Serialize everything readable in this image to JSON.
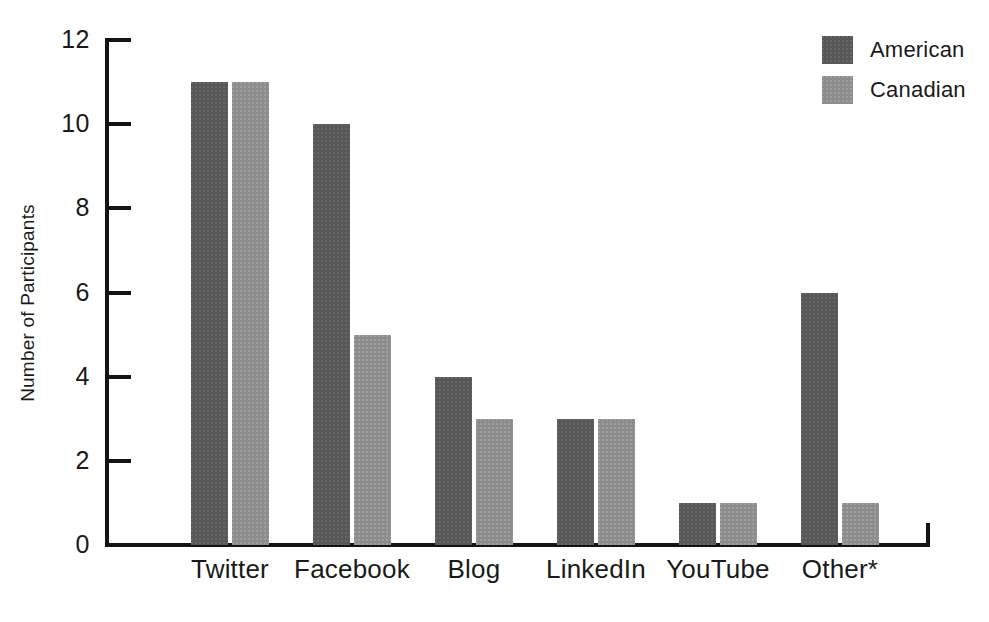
{
  "chart_data": {
    "type": "bar",
    "title": "",
    "xlabel": "",
    "ylabel": "Number of Participants",
    "categories": [
      "Twitter",
      "Facebook",
      "Blog",
      "LinkedIn",
      "YouTube",
      "Other*"
    ],
    "series": [
      {
        "name": "American",
        "color": "#575757",
        "values": [
          11,
          10,
          4,
          3,
          1,
          6
        ]
      },
      {
        "name": "Canadian",
        "color": "#8d8d8d",
        "values": [
          11,
          5,
          3,
          3,
          1,
          1
        ]
      }
    ],
    "ylim": [
      0,
      12
    ],
    "ytick_values": [
      0,
      2,
      4,
      6,
      8,
      10,
      12
    ],
    "ytick_labels": [
      "0",
      "2",
      "4",
      "6",
      "8",
      "10",
      "12"
    ],
    "grid": false,
    "legend_position": "top-right",
    "background_color": "#ffffff",
    "axis_color": "#141414"
  }
}
